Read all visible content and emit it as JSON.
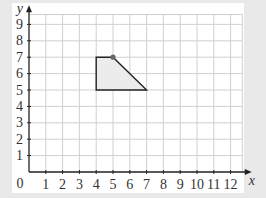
{
  "chart_data": {
    "type": "diagram",
    "title": "",
    "xlabel": "x",
    "ylabel": "y",
    "x_ticks": [
      "1",
      "2",
      "3",
      "4",
      "5",
      "6",
      "7",
      "8",
      "9",
      "10",
      "11",
      "12"
    ],
    "y_ticks": [
      "1",
      "2",
      "3",
      "4",
      "5",
      "6",
      "7",
      "8",
      "9"
    ],
    "origin_label": "0",
    "xlim": [
      0,
      12.5
    ],
    "ylim": [
      0,
      9.6
    ],
    "grid": true,
    "shape": {
      "type": "polygon",
      "vertices": [
        [
          4,
          5
        ],
        [
          4,
          7
        ],
        [
          5,
          7
        ],
        [
          7,
          5
        ]
      ],
      "fill": "#ececec",
      "stroke": "#222222"
    },
    "points": [
      {
        "x": 5,
        "y": 7,
        "color": "#666666"
      }
    ]
  },
  "colors": {
    "background": "#e9e9e9",
    "panel": "#ffffff",
    "grid": "#d0d0d0",
    "axis": "#222222"
  }
}
